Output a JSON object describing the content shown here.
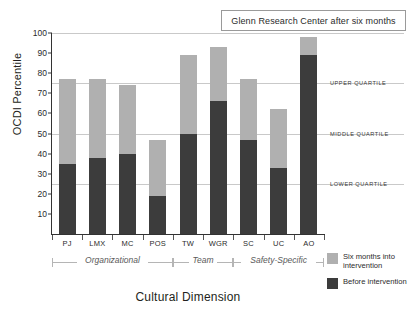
{
  "chart_data": {
    "type": "bar",
    "title": "Glenn Research Center after six months",
    "xlabel": "Cultural Dimension",
    "ylabel": "OCDI Percentile",
    "ylim": [
      0,
      100
    ],
    "ytick_values": [
      10,
      20,
      30,
      40,
      50,
      60,
      70,
      80,
      90,
      100
    ],
    "ytick_labels": [
      "10",
      "20",
      "30",
      "40",
      "50",
      "60",
      "70",
      "80",
      "90",
      "100"
    ],
    "grid": true,
    "gridline_values": [
      25,
      50,
      75,
      100
    ],
    "legend_position": "bottom-right",
    "stacked": true,
    "categories": [
      "PJ",
      "LMX",
      "MC",
      "POS",
      "TW",
      "WGR",
      "SC",
      "UC",
      "AO"
    ],
    "series": [
      {
        "name": "Six months into intervention",
        "color": "#b0b0b0",
        "values": [
          77,
          77,
          74,
          47,
          89,
          93,
          77,
          62,
          98
        ]
      },
      {
        "name": "Before intervention",
        "color": "#3c3c3c",
        "values": [
          35,
          38,
          40,
          19,
          50,
          66,
          47,
          33,
          89
        ]
      }
    ],
    "annotations": [
      {
        "label": "Upper quartile",
        "value": 75
      },
      {
        "label": "Middle quartile",
        "value": 50
      },
      {
        "label": "Lower quartile",
        "value": 25
      }
    ],
    "category_groups": [
      {
        "label": "Organizational",
        "categories": [
          "PJ",
          "LMX",
          "MC",
          "POS"
        ]
      },
      {
        "label": "Team",
        "categories": [
          "TW",
          "WGR"
        ]
      },
      {
        "label": "Safety-Specific",
        "categories": [
          "SC",
          "UC",
          "AO"
        ]
      }
    ]
  },
  "legend": {
    "items": [
      {
        "label": "Six months into intervention",
        "color": "#b0b0b0"
      },
      {
        "label": "Before intervention",
        "color": "#3c3c3c"
      }
    ]
  }
}
